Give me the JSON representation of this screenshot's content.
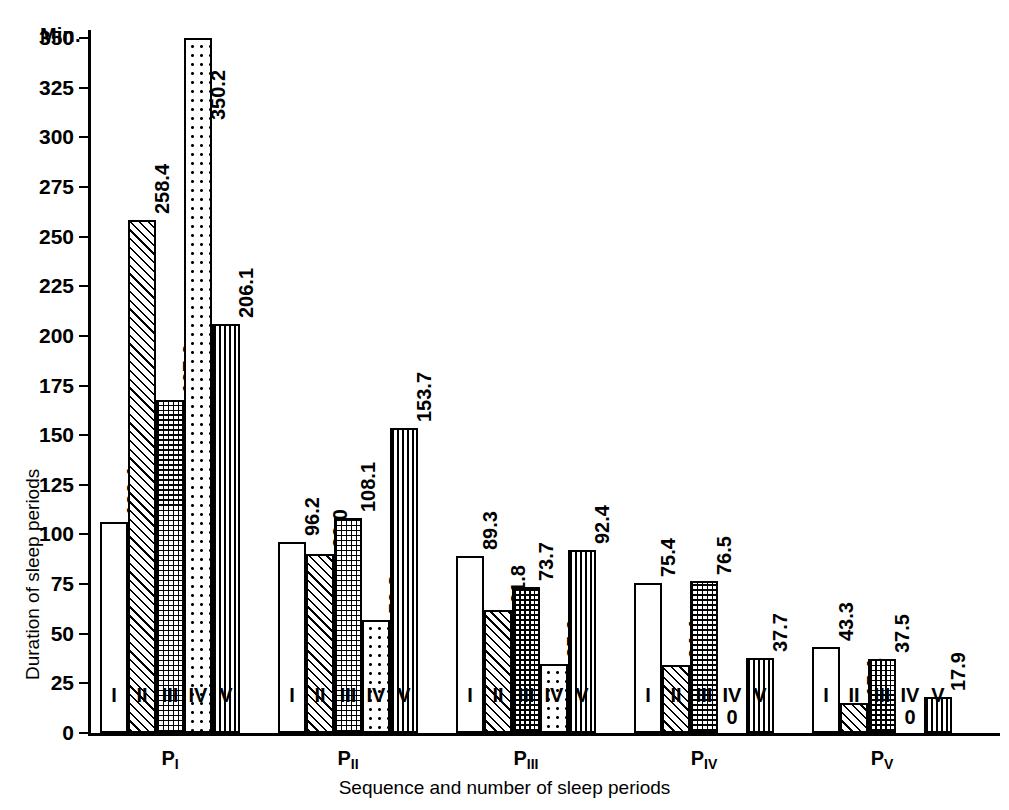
{
  "chart_data": {
    "type": "bar",
    "title": "",
    "unit_label": "Min.",
    "xlabel": "Sequence and number of sleep periods",
    "ylabel": "Duration of sleep periods",
    "ylim": [
      0,
      355
    ],
    "yticks": [
      0,
      25,
      50,
      75,
      100,
      125,
      150,
      175,
      200,
      225,
      250,
      275,
      300,
      325,
      350
    ],
    "grid": false,
    "legend_position": "none",
    "categories": [
      "P₁",
      "P₂",
      "P₃",
      "P₄",
      "P₅"
    ],
    "category_labels": [
      "PI",
      "PII",
      "PIII",
      "PIV",
      "PV"
    ],
    "subgroup_labels": [
      "I",
      "II",
      "III",
      "IV",
      "V"
    ],
    "subgroup_patterns": [
      "blank",
      "diagonal",
      "crosshatch",
      "dotted",
      "vertical"
    ],
    "series": [
      {
        "name": "I",
        "values": [
          106.1,
          96.2,
          89.3,
          75.4,
          43.3
        ]
      },
      {
        "name": "II",
        "values": [
          258.4,
          90.0,
          61.8,
          34.4,
          15.1
        ]
      },
      {
        "name": "III",
        "values": [
          167.6,
          108.1,
          73.7,
          76.5,
          37.5
        ]
      },
      {
        "name": "IV",
        "values": [
          350.2,
          56.8,
          35.0,
          0,
          0
        ]
      },
      {
        "name": "V",
        "values": [
          206.1,
          153.7,
          92.4,
          37.7,
          17.9
        ]
      }
    ],
    "zero_marker": "0"
  },
  "groups": [
    {
      "label_main": "P",
      "label_sub": "I",
      "bars": [
        {
          "roman": "I",
          "value": "106.1",
          "pattern": "blank"
        },
        {
          "roman": "II",
          "value": "258.4",
          "pattern": "diagonal"
        },
        {
          "roman": "III",
          "value": "167.6",
          "pattern": "crosshatch"
        },
        {
          "roman": "IV",
          "value": "350.2",
          "pattern": "dotted"
        },
        {
          "roman": "V",
          "value": "206.1",
          "pattern": "vertical"
        }
      ]
    },
    {
      "label_main": "P",
      "label_sub": "II",
      "bars": [
        {
          "roman": "I",
          "value": "96.2",
          "pattern": "blank"
        },
        {
          "roman": "II",
          "value": "90.0",
          "pattern": "diagonal"
        },
        {
          "roman": "III",
          "value": "108.1",
          "pattern": "crosshatch"
        },
        {
          "roman": "IV",
          "value": "56.8",
          "pattern": "dotted"
        },
        {
          "roman": "V",
          "value": "153.7",
          "pattern": "vertical"
        }
      ]
    },
    {
      "label_main": "P",
      "label_sub": "III",
      "bars": [
        {
          "roman": "I",
          "value": "89.3",
          "pattern": "blank"
        },
        {
          "roman": "II",
          "value": "61.8",
          "pattern": "diagonal"
        },
        {
          "roman": "III",
          "value": "73.7",
          "pattern": "crosshatch"
        },
        {
          "roman": "IV",
          "value": "35.0",
          "pattern": "dotted"
        },
        {
          "roman": "V",
          "value": "92.4",
          "pattern": "vertical"
        }
      ]
    },
    {
      "label_main": "P",
      "label_sub": "IV",
      "bars": [
        {
          "roman": "I",
          "value": "75.4",
          "pattern": "blank"
        },
        {
          "roman": "II",
          "value": "34.4",
          "pattern": "diagonal"
        },
        {
          "roman": "III",
          "value": "76.5",
          "pattern": "crosshatch"
        },
        {
          "roman": "IV",
          "value": "0",
          "pattern": "dotted"
        },
        {
          "roman": "V",
          "value": "37.7",
          "pattern": "vertical"
        }
      ]
    },
    {
      "label_main": "P",
      "label_sub": "V",
      "bars": [
        {
          "roman": "I",
          "value": "43.3",
          "pattern": "blank"
        },
        {
          "roman": "II",
          "value": "15.1",
          "pattern": "diagonal"
        },
        {
          "roman": "III",
          "value": "37.5",
          "pattern": "crosshatch"
        },
        {
          "roman": "IV",
          "value": "0",
          "pattern": "dotted"
        },
        {
          "roman": "V",
          "value": "17.9",
          "pattern": "vertical"
        }
      ]
    }
  ],
  "colors": {
    "ink": "#000000",
    "background": "#ffffff"
  }
}
